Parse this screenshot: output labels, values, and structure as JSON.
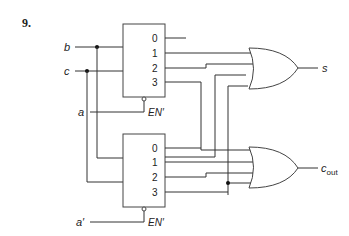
{
  "problem_number": "9.",
  "inputs": {
    "b": "b",
    "c": "c",
    "a": "a",
    "a_prime": "a′"
  },
  "decoder_top": {
    "outputs": [
      "0",
      "1",
      "2",
      "3"
    ],
    "enable_label": "EN′"
  },
  "decoder_bottom": {
    "outputs": [
      "0",
      "1",
      "2",
      "3"
    ],
    "enable_label": "EN′"
  },
  "outputs": {
    "s": "s",
    "cout_main": "c",
    "cout_sub": "out"
  },
  "colors": {
    "line": "#333333",
    "background": "#ffffff"
  }
}
